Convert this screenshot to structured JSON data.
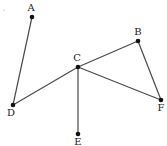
{
  "diagram": {
    "type": "graph",
    "width": 167,
    "height": 146,
    "colors": {
      "edge": "#4a4a4a",
      "node": "#111111",
      "label": "#222222"
    },
    "nodes": [
      {
        "id": "A",
        "label": "A",
        "x": 32,
        "y": 17,
        "lx": 31,
        "ly": 11
      },
      {
        "id": "B",
        "label": "B",
        "x": 138,
        "y": 41,
        "lx": 138,
        "ly": 35
      },
      {
        "id": "C",
        "label": "C",
        "x": 78,
        "y": 67,
        "lx": 77,
        "ly": 61
      },
      {
        "id": "D",
        "label": "D",
        "x": 13,
        "y": 105,
        "lx": 11,
        "ly": 116
      },
      {
        "id": "E",
        "label": "E",
        "x": 78,
        "y": 134,
        "lx": 78,
        "ly": 145
      },
      {
        "id": "F",
        "label": "F",
        "x": 161,
        "y": 100,
        "lx": 161,
        "ly": 111
      }
    ],
    "edges": [
      {
        "from": "A",
        "to": "D"
      },
      {
        "from": "D",
        "to": "C"
      },
      {
        "from": "C",
        "to": "B"
      },
      {
        "from": "B",
        "to": "F"
      },
      {
        "from": "C",
        "to": "F"
      },
      {
        "from": "C",
        "to": "E"
      }
    ]
  }
}
